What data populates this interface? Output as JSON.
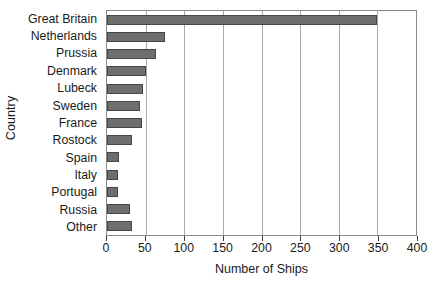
{
  "chart_data": {
    "type": "bar",
    "orientation": "horizontal",
    "title": "",
    "xlabel": "Number of Ships",
    "ylabel": "Country",
    "categories": [
      "Great Britain",
      "Netherlands",
      "Prussia",
      "Denmark",
      "Lubeck",
      "Sweden",
      "France",
      "Rostock",
      "Spain",
      "Italy",
      "Portugal",
      "Russia",
      "Other"
    ],
    "values": [
      350,
      75,
      64,
      51,
      47,
      43,
      45,
      32,
      15,
      14,
      14,
      30,
      33
    ],
    "xlim": [
      0,
      400
    ],
    "xticks": [
      0,
      50,
      100,
      150,
      200,
      250,
      300,
      350,
      400
    ],
    "xtick_labels": [
      "0",
      "50",
      "100",
      "150",
      "200",
      "250",
      "300",
      "350",
      "400"
    ],
    "grid": "vertical",
    "legend": "none",
    "bar_color": "#6e6e6e",
    "bar_border_color": "#474747",
    "gridline_color": "#a9a9a9",
    "frame_color": "#8a8a8a",
    "background": "#ffffff"
  }
}
